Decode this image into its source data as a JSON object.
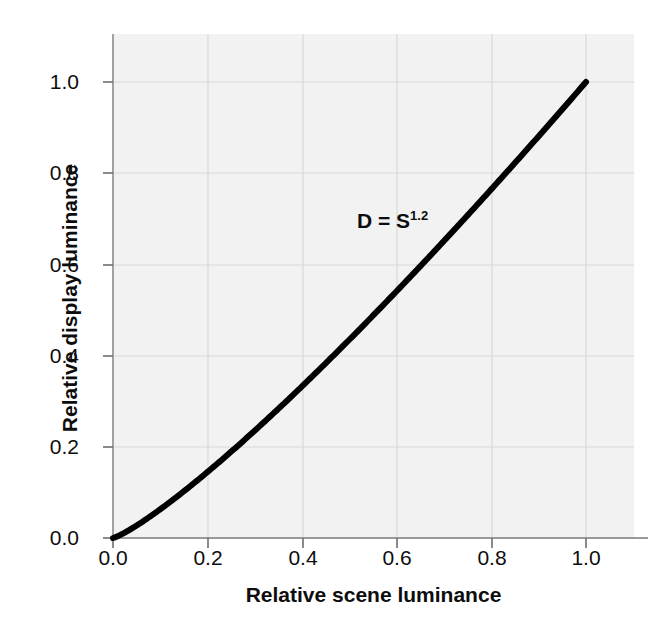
{
  "figure": {
    "background_color": "#ffffff",
    "plot_background_color": "#f2f2f2",
    "curve_color": "#000000",
    "gridline_color": "#d8d8d8",
    "spine_color": "#9a9a9a",
    "text_color": "#0d0d0d"
  },
  "chart_data": {
    "type": "line",
    "title": "",
    "subtitle": "",
    "xlabel": "Relative scene luminance",
    "ylabel": "Relative display luminance",
    "xlim": [
      0.0,
      1.1
    ],
    "ylim": [
      0.0,
      1.1
    ],
    "xticks": [
      0.0,
      0.2,
      0.4,
      0.6,
      0.8,
      1.0
    ],
    "yticks": [
      0.0,
      0.2,
      0.4,
      0.6,
      0.8,
      1.0
    ],
    "xticklabels": [
      "0.0",
      "0.2",
      "0.4",
      "0.6",
      "0.8",
      "1.0"
    ],
    "yticklabels": [
      "0.0",
      "0.2",
      "0.4",
      "0.6",
      "0.8",
      "1.0"
    ],
    "grid": true,
    "legend": false,
    "legend_position": "none",
    "annotations": [
      {
        "text_base": "D = S",
        "text_exponent": "1.2",
        "full_text": "D = S^1.2",
        "x": 0.47,
        "y": 0.645
      }
    ],
    "series": [
      {
        "name": "D = S^1.2",
        "equation": "D = S^1.2",
        "exponent": 1.2,
        "line_width": 6,
        "color": "#000000",
        "x": [
          0.0,
          0.05,
          0.1,
          0.15,
          0.2,
          0.25,
          0.3,
          0.35,
          0.4,
          0.45,
          0.5,
          0.55,
          0.6,
          0.65,
          0.7,
          0.75,
          0.8,
          0.85,
          0.9,
          0.95,
          1.0
        ],
        "y": [
          0.0,
          0.035,
          0.063,
          0.1,
          0.145,
          0.189,
          0.236,
          0.284,
          0.333,
          0.384,
          0.435,
          0.488,
          0.542,
          0.596,
          0.651,
          0.708,
          0.765,
          0.822,
          0.88,
          0.94,
          1.0
        ]
      }
    ]
  },
  "ghost_text": {
    "lines": [
      "e seen in teeth, there is a little curve in the highl",
      "and for mid-tones of the scene it is not at unity",
      "degree of contrast in mid-tone scaling. Compa",
      "n of television and photography continue to",
      "( 1 ). system of the tone reproduction is handle",
      "er equation ( 2 ) and it can be possibly im",
      "equation"
    ],
    "heading": "the Contrast Law to the Viewing Envi",
    "tail_lines": [
      "hat relevance of contrast in the surroundi",
      "tive image has a lower brightness than the ori",
      "conditions, increasing gulf that is happen to a"
    ]
  }
}
